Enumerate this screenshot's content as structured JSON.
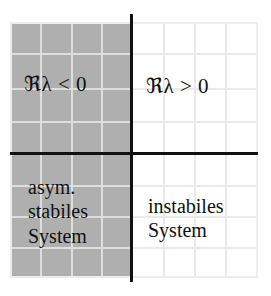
{
  "figure": {
    "background_color": "#ffffff",
    "shaded_color": "#afafaf",
    "axis_color": "#111111",
    "grid_color": "#e9e9e9"
  },
  "axes": {
    "vertical_axis_name": "imaginary-axis",
    "horizontal_axis_name": "real-axis",
    "grid_columns": 8,
    "grid_rows": 8
  },
  "quadrants": {
    "upper_left": {
      "condition": "ℜλ < 0",
      "shaded": true
    },
    "upper_right": {
      "condition": "ℜλ > 0",
      "shaded": false
    },
    "lower_left": {
      "description": "asym.\nstabiles\nSystem",
      "shaded": true
    },
    "lower_right": {
      "description": "instabiles\nSystem",
      "shaded": false
    }
  }
}
